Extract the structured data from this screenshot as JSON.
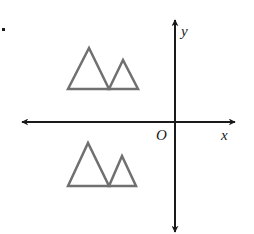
{
  "diagram": {
    "labels": {
      "y_axis": "y",
      "x_axis": "x",
      "origin": "O"
    },
    "colors": {
      "axis": "#1a1a1a",
      "shape_stroke": "#707070",
      "background": "#ffffff"
    },
    "axes": {
      "origin_px": [
        175,
        122
      ],
      "x_axis": {
        "from_px": [
          22,
          122
        ],
        "to_px": [
          235,
          122
        ],
        "arrows": "both"
      },
      "y_axis": {
        "from_px": [
          175,
          232
        ],
        "to_px": [
          175,
          20
        ],
        "arrows": "both"
      }
    },
    "figures": [
      {
        "name": "upper-mountain-figure",
        "quadrant": "II",
        "triangles": [
          {
            "apex": [
              89,
              48
            ],
            "base_left": [
              68,
              89
            ],
            "base_right": [
              109,
              89
            ]
          },
          {
            "apex": [
              123,
              60
            ],
            "base_left": [
              109,
              89
            ],
            "base_right": [
              138,
              89
            ]
          }
        ]
      },
      {
        "name": "lower-mountain-figure",
        "quadrant": "III",
        "triangles": [
          {
            "apex": [
              88,
              143
            ],
            "base_left": [
              68,
              186
            ],
            "base_right": [
              109,
              186
            ]
          },
          {
            "apex": [
              122,
              156
            ],
            "base_left": [
              109,
              186
            ],
            "base_right": [
              136,
              186
            ]
          }
        ]
      }
    ]
  }
}
